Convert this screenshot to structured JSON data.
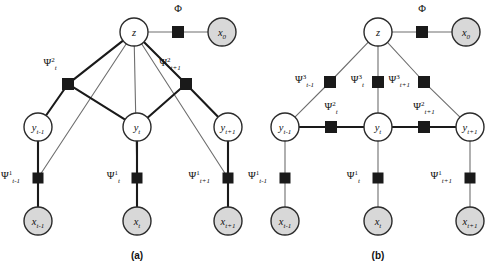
{
  "figure": {
    "type": "factor-graph-diagram",
    "panels": [
      {
        "id": "a",
        "caption": "(a)",
        "caption_pos": {
          "x": 137,
          "y": 259
        },
        "variable_nodes": [
          {
            "name": "z",
            "label": "z",
            "x": 134,
            "y": 32,
            "r": 14,
            "shaded": false
          },
          {
            "name": "x0",
            "label": "x",
            "sub": "0",
            "x": 222,
            "y": 32,
            "r": 14,
            "shaded": true
          },
          {
            "name": "ytm1",
            "label": "y",
            "sub": "t-1",
            "x": 38,
            "y": 127,
            "r": 14,
            "shaded": false
          },
          {
            "name": "yt",
            "label": "y",
            "sub": "t",
            "x": 137,
            "y": 127,
            "r": 14,
            "shaded": false
          },
          {
            "name": "ytp1",
            "label": "y",
            "sub": "t+1",
            "x": 228,
            "y": 127,
            "r": 14,
            "shaded": false
          },
          {
            "name": "xtm1",
            "label": "x",
            "sub": "t-1",
            "x": 38,
            "y": 221,
            "r": 14,
            "shaded": true
          },
          {
            "name": "xt",
            "label": "x",
            "sub": "t",
            "x": 137,
            "y": 221,
            "r": 14,
            "shaded": true
          },
          {
            "name": "xtp1",
            "label": "x",
            "sub": "t+1",
            "x": 228,
            "y": 221,
            "r": 14,
            "shaded": true
          }
        ],
        "factor_nodes": [
          {
            "name": "phi",
            "x": 178,
            "y": 32,
            "s": 11,
            "label": "Φ",
            "sup": "",
            "sub": "",
            "lx": 178,
            "ly": 12,
            "anchor": "middle"
          },
          {
            "name": "psi2-t",
            "x": 68,
            "y": 84,
            "s": 11,
            "label": "Ψ",
            "sup": "2",
            "sub": "t",
            "lx": 50,
            "ly": 66,
            "anchor": "middle"
          },
          {
            "name": "psi2-tp1",
            "x": 186,
            "y": 84,
            "s": 11,
            "label": "Ψ",
            "sup": "2",
            "sub": "t+1",
            "lx": 170,
            "ly": 66,
            "anchor": "middle"
          },
          {
            "name": "psi1-tm1",
            "x": 38,
            "y": 178,
            "s": 10,
            "label": "Ψ",
            "sup": "1",
            "sub": "t-1",
            "lx": 20,
            "ly": 179,
            "anchor": "end"
          },
          {
            "name": "psi1-t",
            "x": 137,
            "y": 178,
            "s": 10,
            "label": "Ψ",
            "sup": "1",
            "sub": "t",
            "lx": 120,
            "ly": 179,
            "anchor": "end"
          },
          {
            "name": "psi1-tp1",
            "x": 228,
            "y": 178,
            "s": 10,
            "label": "Ψ",
            "sup": "1",
            "sub": "t+1",
            "lx": 210,
            "ly": 179,
            "anchor": "end"
          }
        ],
        "edges_thin": [
          {
            "from": "z",
            "to": "psi1-tm1"
          },
          {
            "from": "z",
            "to": "psi1-t"
          },
          {
            "from": "z",
            "to": "psi1-tp1"
          },
          {
            "from": "z",
            "to": "phi"
          },
          {
            "from": "phi",
            "to": "x0"
          }
        ],
        "edges_thick": [
          {
            "from": "z",
            "to": "psi2-t"
          },
          {
            "from": "z",
            "to": "psi2-tp1"
          },
          {
            "from": "psi2-t",
            "to": "ytm1"
          },
          {
            "from": "psi2-t",
            "to": "yt"
          },
          {
            "from": "psi2-tp1",
            "to": "yt"
          },
          {
            "from": "psi2-tp1",
            "to": "ytp1"
          },
          {
            "from": "ytm1",
            "to": "psi1-tm1"
          },
          {
            "from": "yt",
            "to": "psi1-t"
          },
          {
            "from": "ytp1",
            "to": "psi1-tp1"
          },
          {
            "from": "psi1-tm1",
            "to": "xtm1"
          },
          {
            "from": "psi1-t",
            "to": "xt"
          },
          {
            "from": "psi1-tp1",
            "to": "xtp1"
          }
        ]
      },
      {
        "id": "b",
        "caption": "(b)",
        "caption_pos": {
          "x": 378,
          "y": 259
        },
        "variable_nodes": [
          {
            "name": "z",
            "label": "z",
            "x": 378,
            "y": 32,
            "r": 14,
            "shaded": false
          },
          {
            "name": "x0",
            "label": "x",
            "sub": "0",
            "x": 466,
            "y": 32,
            "r": 14,
            "shaded": true
          },
          {
            "name": "ytm1",
            "label": "y",
            "sub": "t-1",
            "x": 285,
            "y": 127,
            "r": 14,
            "shaded": false
          },
          {
            "name": "yt",
            "label": "y",
            "sub": "t",
            "x": 378,
            "y": 127,
            "r": 14,
            "shaded": false
          },
          {
            "name": "ytp1",
            "label": "y",
            "sub": "t+1",
            "x": 470,
            "y": 127,
            "r": 14,
            "shaded": false
          },
          {
            "name": "xtm1",
            "label": "x",
            "sub": "t-1",
            "x": 285,
            "y": 221,
            "r": 14,
            "shaded": true
          },
          {
            "name": "xt",
            "label": "x",
            "sub": "t",
            "x": 378,
            "y": 221,
            "r": 14,
            "shaded": true
          },
          {
            "name": "xtp1",
            "label": "x",
            "sub": "t+1",
            "x": 470,
            "y": 221,
            "r": 14,
            "shaded": true
          }
        ],
        "factor_nodes": [
          {
            "name": "phi",
            "x": 422,
            "y": 32,
            "s": 11,
            "label": "Φ",
            "sup": "",
            "sub": "",
            "lx": 422,
            "ly": 12,
            "anchor": "middle"
          },
          {
            "name": "psi3-tm1",
            "x": 330,
            "y": 82,
            "s": 11,
            "label": "Ψ",
            "sup": "3",
            "sub": "t-1",
            "lx": 314,
            "ly": 83,
            "anchor": "end"
          },
          {
            "name": "psi3-t",
            "x": 378,
            "y": 82,
            "s": 11,
            "label": "Ψ",
            "sup": "3",
            "sub": "t",
            "lx": 364,
            "ly": 83,
            "anchor": "end"
          },
          {
            "name": "psi3-tp1",
            "x": 424,
            "y": 82,
            "s": 11,
            "label": "Ψ",
            "sup": "3",
            "sub": "t+1",
            "lx": 410,
            "ly": 83,
            "anchor": "end"
          },
          {
            "name": "psi2-t",
            "x": 331,
            "y": 127,
            "s": 11,
            "label": "Ψ",
            "sup": "2",
            "sub": "t",
            "lx": 331,
            "ly": 110,
            "anchor": "middle"
          },
          {
            "name": "psi2-tp1",
            "x": 424,
            "y": 127,
            "s": 11,
            "label": "Ψ",
            "sup": "2",
            "sub": "t+1",
            "lx": 424,
            "ly": 110,
            "anchor": "middle"
          },
          {
            "name": "psi1-tm1",
            "x": 285,
            "y": 178,
            "s": 10,
            "label": "Ψ",
            "sup": "1",
            "sub": "t-1",
            "lx": 267,
            "ly": 179,
            "anchor": "end"
          },
          {
            "name": "psi1-t",
            "x": 378,
            "y": 178,
            "s": 10,
            "label": "Ψ",
            "sup": "1",
            "sub": "t",
            "lx": 360,
            "ly": 179,
            "anchor": "end"
          },
          {
            "name": "psi1-tp1",
            "x": 470,
            "y": 178,
            "s": 10,
            "label": "Ψ",
            "sup": "1",
            "sub": "t+1",
            "lx": 452,
            "ly": 179,
            "anchor": "end"
          }
        ],
        "edges_thin": [
          {
            "from": "z",
            "to": "phi"
          },
          {
            "from": "phi",
            "to": "x0"
          },
          {
            "from": "z",
            "to": "psi3-tm1"
          },
          {
            "from": "z",
            "to": "psi3-t"
          },
          {
            "from": "z",
            "to": "psi3-tp1"
          },
          {
            "from": "psi3-tm1",
            "to": "ytm1"
          },
          {
            "from": "psi3-t",
            "to": "yt"
          },
          {
            "from": "psi3-tp1",
            "to": "ytp1"
          },
          {
            "from": "ytm1",
            "to": "psi1-tm1"
          },
          {
            "from": "yt",
            "to": "psi1-t"
          },
          {
            "from": "ytp1",
            "to": "psi1-tp1"
          },
          {
            "from": "psi1-tm1",
            "to": "xtm1"
          },
          {
            "from": "psi1-t",
            "to": "xt"
          },
          {
            "from": "psi1-tp1",
            "to": "xtp1"
          }
        ],
        "edges_thick": [
          {
            "from": "ytm1",
            "to": "psi2-t"
          },
          {
            "from": "psi2-t",
            "to": "yt"
          },
          {
            "from": "yt",
            "to": "psi2-tp1"
          },
          {
            "from": "psi2-tp1",
            "to": "ytp1"
          }
        ]
      }
    ],
    "colors": {
      "node_stroke": "#2b2b2b",
      "node_fill_open": "#ffffff",
      "node_fill_shaded": "#d8d8d8",
      "factor_fill": "#1a1a1a",
      "edge_thin": "#6e6e6e",
      "edge_thick": "#1a1a1a",
      "text": "#111111",
      "background": "#ffffff"
    }
  }
}
